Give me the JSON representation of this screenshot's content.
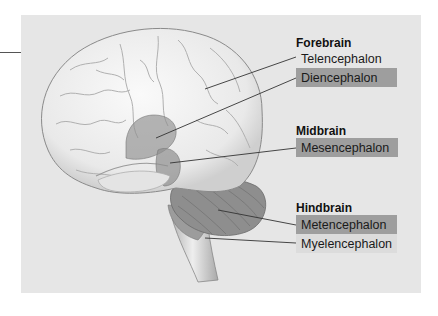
{
  "figure": {
    "colors": {
      "panel_bg": "#e6e6e6",
      "highlight_box": "#9e9e9e",
      "faint_box": "#dcdcdc",
      "brain_fill": "#f2f2f2",
      "highlight_region": "#9a9a9a",
      "leader_line": "#333333"
    }
  },
  "groups": [
    {
      "title": "Forebrain",
      "labels": [
        {
          "text": "Telencephalon",
          "highlighted": false
        },
        {
          "text": "Diencephalon",
          "highlighted": true
        }
      ]
    },
    {
      "title": "Midbrain",
      "labels": [
        {
          "text": "Mesencephalon",
          "highlighted": true
        }
      ]
    },
    {
      "title": "Hindbrain",
      "labels": [
        {
          "text": "Metencephalon",
          "highlighted": true
        },
        {
          "text": "Myelencephalon",
          "highlighted": false
        }
      ]
    }
  ]
}
